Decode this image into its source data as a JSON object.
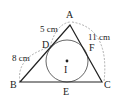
{
  "diagram": {
    "vertices": {
      "A": {
        "label": "A",
        "x": 70,
        "y": 25
      },
      "B": {
        "label": "B",
        "x": 20,
        "y": 82
      },
      "C": {
        "label": "C",
        "x": 102,
        "y": 82
      }
    },
    "tangent_points": {
      "D": {
        "label": "D",
        "x": 49,
        "y": 49
      },
      "E": {
        "label": "E",
        "x": 67,
        "y": 82
      },
      "F": {
        "label": "F",
        "x": 90,
        "y": 49
      }
    },
    "incenter": {
      "label": "I",
      "x": 67,
      "y": 61,
      "radius": 21
    },
    "measurements": [
      {
        "id": "AD",
        "label": "5 cm"
      },
      {
        "id": "BD",
        "label": "8 cm"
      },
      {
        "id": "AC",
        "label": "11 cm"
      }
    ],
    "colors": {
      "lines": "#222222",
      "dashed": "#9a9a9a",
      "circle": "#555555"
    }
  }
}
